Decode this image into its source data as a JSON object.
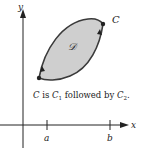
{
  "diagram": {
    "axes": {
      "x_label": "x",
      "y_label": "y",
      "ticks": [
        {
          "label": "a"
        },
        {
          "label": "b"
        }
      ]
    },
    "region": {
      "label": "𝒟",
      "fill": "#cfcfcf",
      "stroke": "#3a3a3a"
    },
    "curve_label": "C",
    "caption": {
      "c": "C",
      "is": " is ",
      "c1": "C",
      "sub1": "1",
      "followed_by": " followed by ",
      "c2": "C",
      "sub2": "2",
      "end": "."
    },
    "colors": {
      "axis": "#222222",
      "background": "#ffffff"
    }
  }
}
